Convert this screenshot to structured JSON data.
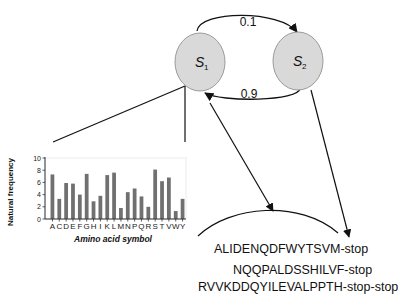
{
  "diagram": {
    "states": [
      {
        "id": "s1",
        "label": "S",
        "subscript": "1"
      },
      {
        "id": "s2",
        "label": "S",
        "subscript": "2"
      }
    ],
    "transitions": [
      {
        "from": "s1",
        "to": "s2",
        "label": "0.1"
      },
      {
        "from": "s2",
        "to": "s1",
        "label": "0.9"
      }
    ],
    "sequences": [
      "ALIDENQDFWYTSVM-stop",
      "NQQPALDSSHILVF-stop",
      "RVVKDDQYILEVALPPTH-stop-stop"
    ],
    "colors": {
      "state_fill": "#d9d9d9",
      "state_stroke": "#9a9a9a",
      "bar": "#707070",
      "line": "#111111"
    }
  },
  "chart_data": {
    "type": "bar",
    "title": "",
    "xlabel": "Amino acid symbol",
    "ylabel": "Natural frequency",
    "ylim": [
      0,
      10
    ],
    "yticks": [
      "0",
      "2",
      "4",
      "6",
      "8",
      "10"
    ],
    "grid": false,
    "legend": null,
    "categories": [
      "A",
      "C",
      "D",
      "E",
      "F",
      "G",
      "H",
      "I",
      "K",
      "L",
      "M",
      "N",
      "P",
      "Q",
      "R",
      "S",
      "T",
      "V",
      "W",
      "Y"
    ],
    "values": [
      7.3,
      3.3,
      5.9,
      5.8,
      4.0,
      7.4,
      2.9,
      3.8,
      7.2,
      7.6,
      1.8,
      4.4,
      5.0,
      3.7,
      2.0,
      8.1,
      6.2,
      6.8,
      1.3,
      3.3
    ]
  }
}
